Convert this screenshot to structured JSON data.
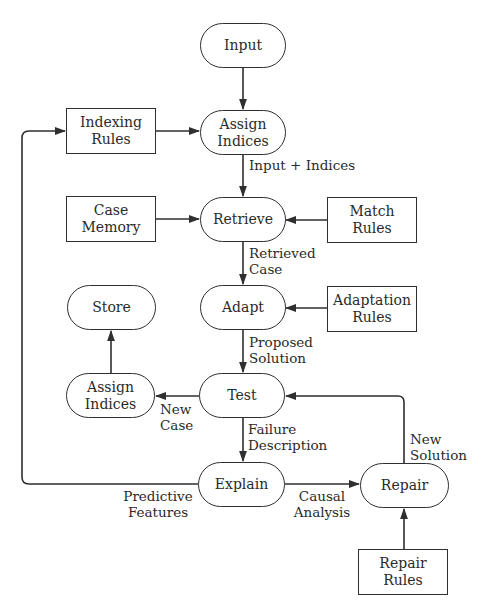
{
  "diagram": {
    "type": "flowchart",
    "nodes": {
      "input": "Input",
      "assign_indices_top": "Assign\nIndices",
      "indexing_rules": "Indexing\nRules",
      "case_memory": "Case\nMemory",
      "retrieve": "Retrieve",
      "match_rules": "Match\nRules",
      "store": "Store",
      "adapt": "Adapt",
      "adaptation_rules": "Adaptation\nRules",
      "assign_indices_bottom": "Assign\nIndices",
      "test": "Test",
      "explain": "Explain",
      "repair": "Repair",
      "repair_rules": "Repair\nRules"
    },
    "edge_labels": {
      "input_plus_indices": "Input + Indices",
      "retrieved_case": "Retrieved\nCase",
      "proposed_solution": "Proposed\nSolution",
      "new_case": "New\nCase",
      "failure_description": "Failure\nDescription",
      "new_solution": "New\nSolution",
      "predictive_features": "Predictive\nFeatures",
      "causal_analysis": "Causal\nAnalysis"
    },
    "edges": [
      {
        "from": "Input",
        "to": "Assign Indices"
      },
      {
        "from": "Indexing Rules",
        "to": "Assign Indices"
      },
      {
        "from": "Assign Indices",
        "to": "Retrieve",
        "label": "Input + Indices"
      },
      {
        "from": "Case Memory",
        "to": "Retrieve"
      },
      {
        "from": "Match Rules",
        "to": "Retrieve"
      },
      {
        "from": "Retrieve",
        "to": "Adapt",
        "label": "Retrieved Case"
      },
      {
        "from": "Adaptation Rules",
        "to": "Adapt"
      },
      {
        "from": "Adapt",
        "to": "Test",
        "label": "Proposed Solution"
      },
      {
        "from": "Test",
        "to": "Assign Indices (bottom)",
        "label": "New Case"
      },
      {
        "from": "Assign Indices (bottom)",
        "to": "Store"
      },
      {
        "from": "Test",
        "to": "Explain",
        "label": "Failure Description"
      },
      {
        "from": "Explain",
        "to": "Repair",
        "label": "Causal Analysis"
      },
      {
        "from": "Explain",
        "to": "Indexing Rules",
        "label": "Predictive Features"
      },
      {
        "from": "Repair Rules",
        "to": "Repair"
      },
      {
        "from": "Repair",
        "to": "Test",
        "label": "New Solution"
      }
    ],
    "colors": {
      "stroke": "#2f2f2f",
      "text": "#2a2a2a",
      "background": "#ffffff"
    }
  }
}
